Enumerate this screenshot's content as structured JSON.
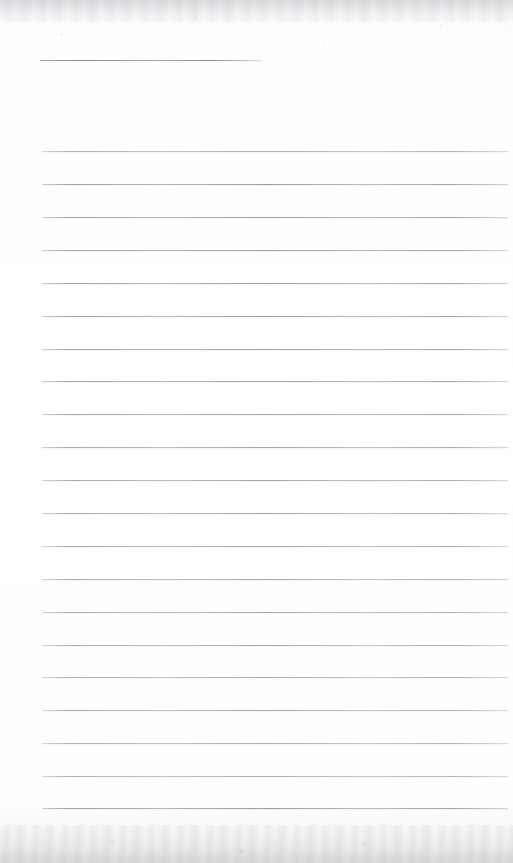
{
  "document": {
    "kind": "scanned-ruled-paper",
    "title": "Blank ruled notebook page (scan)",
    "page_width": 513,
    "page_height": 863,
    "text_content": "",
    "handwriting_present": "no",
    "printed_text_present": "no"
  },
  "paper": {
    "background_color": "#fefefe",
    "edge_tone_color": "#ededee",
    "rule_color": "#969aa3",
    "rule_thickness_px": 1,
    "left_margin_x": 42,
    "right_edge_x": 508,
    "line_spacing_px": 32.85,
    "vertical_margin_rule": "none"
  },
  "rules": {
    "short_rule": {
      "label": "top short rule",
      "x": 40,
      "y": 60,
      "width": 222
    },
    "full_rules": [
      {
        "y": 151
      },
      {
        "y": 184
      },
      {
        "y": 217
      },
      {
        "y": 250
      },
      {
        "y": 283
      },
      {
        "y": 316
      },
      {
        "y": 349
      },
      {
        "y": 381
      },
      {
        "y": 414
      },
      {
        "y": 447
      },
      {
        "y": 480
      },
      {
        "y": 513
      },
      {
        "y": 546
      },
      {
        "y": 579
      },
      {
        "y": 612
      },
      {
        "y": 645
      },
      {
        "y": 677
      },
      {
        "y": 710
      },
      {
        "y": 743
      },
      {
        "y": 776
      },
      {
        "y": 808
      }
    ],
    "full_rule_x": 42,
    "full_rule_width": 466,
    "count_full_rules": 21,
    "count_short_rules": 1
  }
}
